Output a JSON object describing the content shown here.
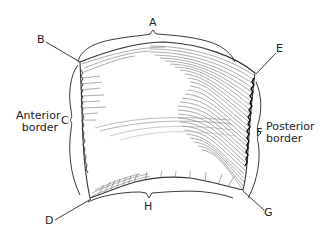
{
  "figure": {
    "labels": {
      "A": "A",
      "B": "B",
      "C": "C",
      "D": "D",
      "E": "E",
      "F": "F",
      "G": "G",
      "H": "H"
    },
    "anterior": {
      "line1": "Anterior",
      "line2": "border"
    },
    "posterior": {
      "line1": "Posterior",
      "line2": "border"
    }
  },
  "colors": {
    "ink": "#222222",
    "hatch": "#555555",
    "background": "#ffffff"
  }
}
